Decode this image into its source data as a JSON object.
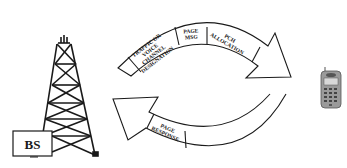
{
  "diagram": {
    "type": "paging-cycle",
    "nodes": {
      "base_station": {
        "label": "BS",
        "icon": "cell-tower-icon"
      },
      "mobile": {
        "icon": "mobile-phone-icon"
      }
    },
    "forward_arrow": {
      "direction": "BS to mobile",
      "segments": [
        {
          "lines": [
            "TRAFFIC OR",
            "VOICE",
            "CHANNEL",
            "DESIGNATION"
          ]
        },
        {
          "lines": [
            "PAGE",
            "MSG"
          ]
        },
        {
          "lines": [
            "PCH",
            "ALLOCATION"
          ]
        }
      ]
    },
    "return_arrow": {
      "direction": "mobile to BS",
      "segments": [
        {
          "lines": [
            "PAGE",
            "RESPONSE"
          ]
        }
      ]
    },
    "colors": {
      "stroke": "#1a1a1a",
      "background": "#ffffff",
      "phone_body": "#9a9a9a"
    }
  }
}
